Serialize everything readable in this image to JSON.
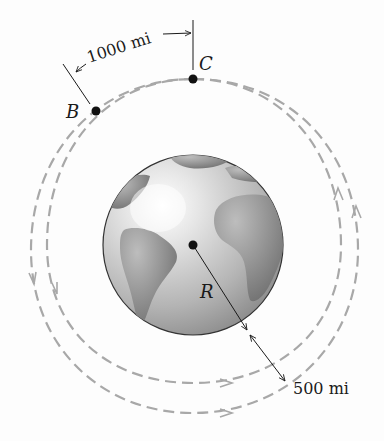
{
  "diagram": {
    "labels": {
      "point_b": "B",
      "point_c": "C",
      "radius": "R",
      "arc_distance": "1000 mi",
      "altitude": "500 mi"
    },
    "colors": {
      "orbit_dash": "#a8a8a8",
      "earth_ocean": "#c8c8c8",
      "earth_land": "#808080",
      "ink": "#1a1a1a"
    }
  }
}
